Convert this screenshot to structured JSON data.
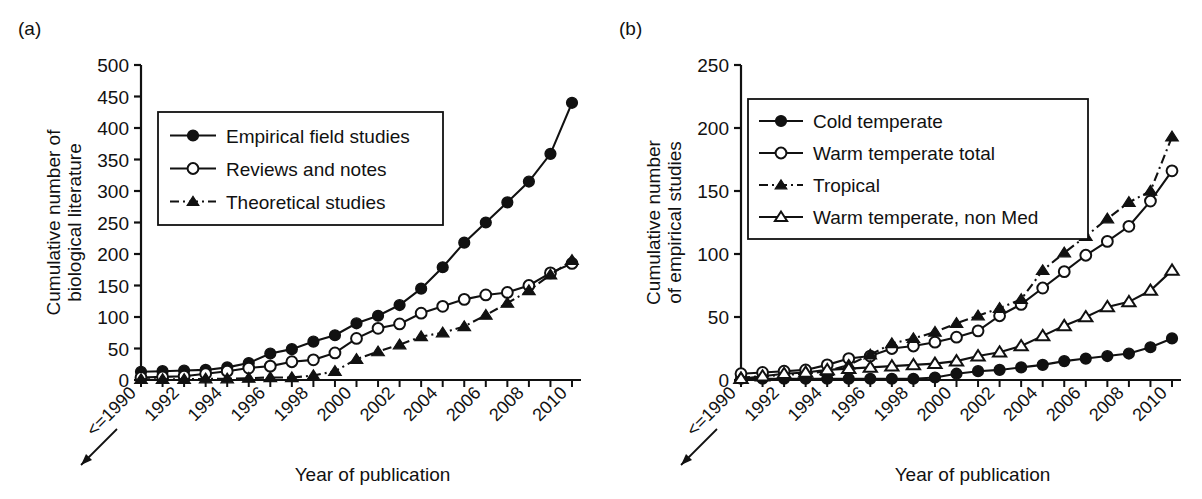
{
  "figure": {
    "panel_a_label": "(a)",
    "panel_b_label": "(b)"
  },
  "chart_data": [
    {
      "id": "panel-a",
      "type": "line",
      "title": "(a)",
      "xlabel": "Year of publication",
      "ylabel": "Cumulative number of biological literature",
      "ylabel_line1": "Cumulative number of",
      "ylabel_line2": "biological literature",
      "ylim": [
        0,
        500
      ],
      "yticks": [
        0,
        50,
        100,
        150,
        200,
        250,
        300,
        350,
        400,
        450,
        500
      ],
      "ytick_labels": [
        "0",
        "50",
        "100",
        "150",
        "200",
        "250",
        "300",
        "350",
        "400",
        "450",
        "500"
      ],
      "x": [
        "<=1990",
        "1991",
        "1992",
        "1993",
        "1994",
        "1995",
        "1996",
        "1997",
        "1998",
        "1999",
        "2000",
        "2001",
        "2002",
        "2003",
        "2004",
        "2005",
        "2006",
        "2007",
        "2008",
        "2009",
        "2010"
      ],
      "xtick_labels": [
        "<=1990",
        "1992",
        "1994",
        "1996",
        "1998",
        "2000",
        "2002",
        "2004",
        "2006",
        "2008",
        "2010"
      ],
      "xtick_label_indices": [
        0,
        2,
        4,
        6,
        8,
        10,
        12,
        14,
        16,
        18,
        20
      ],
      "grid": false,
      "legend_position": "upper-left",
      "series": [
        {
          "name": "Empirical field studies",
          "marker": "filled-circle",
          "line": "solid",
          "values": [
            13,
            14,
            15,
            16,
            20,
            27,
            42,
            49,
            61,
            71,
            90,
            102,
            119,
            145,
            179,
            218,
            250,
            282,
            315,
            359,
            440
          ]
        },
        {
          "name": "Reviews and notes",
          "marker": "open-circle",
          "line": "solid",
          "values": [
            4,
            5,
            6,
            10,
            14,
            19,
            22,
            29,
            32,
            43,
            66,
            82,
            89,
            106,
            117,
            128,
            135,
            139,
            150,
            170,
            185
          ]
        },
        {
          "name": "Theoretical studies",
          "marker": "filled-triangle",
          "line": "dash-dot",
          "values": [
            1,
            1,
            1,
            2,
            2,
            3,
            4,
            4,
            7,
            14,
            33,
            45,
            56,
            69,
            75,
            85,
            103,
            122,
            142,
            167,
            190
          ]
        }
      ]
    },
    {
      "id": "panel-b",
      "type": "line",
      "title": "(b)",
      "xlabel": "Year of publication",
      "ylabel": "Cumulative number of empirical studies",
      "ylabel_line1": "Cumulative number",
      "ylabel_line2": "of empirical studies",
      "ylim": [
        0,
        250
      ],
      "yticks": [
        0,
        50,
        100,
        150,
        200,
        250
      ],
      "ytick_labels": [
        "0",
        "50",
        "100",
        "150",
        "200",
        "250"
      ],
      "x": [
        "<=1990",
        "1991",
        "1992",
        "1993",
        "1994",
        "1995",
        "1996",
        "1997",
        "1998",
        "1999",
        "2000",
        "2001",
        "2002",
        "2003",
        "2004",
        "2005",
        "2006",
        "2007",
        "2008",
        "2009",
        "2010"
      ],
      "xtick_labels": [
        "<=1990",
        "1992",
        "1994",
        "1996",
        "1998",
        "2000",
        "2002",
        "2004",
        "2006",
        "2008",
        "2010"
      ],
      "xtick_label_indices": [
        0,
        2,
        4,
        6,
        8,
        10,
        12,
        14,
        16,
        18,
        20
      ],
      "grid": false,
      "legend_position": "upper-left",
      "series": [
        {
          "name": "Cold temperate",
          "marker": "filled-circle",
          "line": "solid",
          "values": [
            1,
            1,
            1,
            1,
            1,
            1,
            1,
            1,
            1,
            2,
            5,
            7,
            8,
            10,
            12,
            15,
            17,
            19,
            21,
            26,
            33
          ]
        },
        {
          "name": "Warm temperate total",
          "marker": "open-circle",
          "line": "solid",
          "values": [
            5,
            6,
            7,
            8,
            12,
            17,
            19,
            25,
            27,
            30,
            34,
            39,
            51,
            60,
            73,
            86,
            99,
            110,
            122,
            142,
            166
          ]
        },
        {
          "name": "Tropical",
          "marker": "filled-triangle",
          "line": "dash-dot",
          "values": [
            2,
            3,
            4,
            5,
            7,
            12,
            20,
            29,
            33,
            38,
            45,
            51,
            57,
            64,
            87,
            101,
            114,
            128,
            141,
            150,
            193
          ]
        },
        {
          "name": "Warm temperate, non Med",
          "marker": "open-triangle",
          "line": "solid",
          "values": [
            1,
            3,
            5,
            6,
            8,
            9,
            10,
            11,
            12,
            13,
            15,
            19,
            22,
            27,
            35,
            43,
            50,
            58,
            62,
            71,
            87
          ]
        }
      ]
    }
  ]
}
